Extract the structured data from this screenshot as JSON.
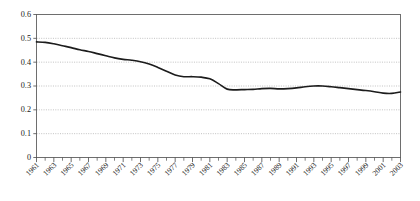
{
  "chart_data": {
    "type": "line",
    "title": "",
    "subtitle": "",
    "xlabel": "",
    "ylabel": "",
    "ylim": [
      0,
      0.6
    ],
    "xlim": [
      1961,
      2003
    ],
    "grid": true,
    "grid_orientation": "horizontal",
    "legend": false,
    "legend_position": "none",
    "yticks": [
      "0",
      "0.1",
      "0.2",
      "0.3",
      "0.4",
      "0.5",
      "0.6"
    ],
    "ytick_values": [
      0,
      0.1,
      0.2,
      0.3,
      0.4,
      0.5,
      0.6
    ],
    "xtick_labels": [
      "1961",
      "1963",
      "1965",
      "1967",
      "1969",
      "1971",
      "1973",
      "1975",
      "1977",
      "1979",
      "1981",
      "1983",
      "1985",
      "1987",
      "1989",
      "1991",
      "1993",
      "1995",
      "1997",
      "1999",
      "2001",
      "2003"
    ],
    "xtick_label_values": [
      1961,
      1963,
      1965,
      1967,
      1969,
      1971,
      1973,
      1975,
      1977,
      1979,
      1981,
      1983,
      1985,
      1987,
      1989,
      1991,
      1993,
      1995,
      1997,
      1999,
      2001,
      2003
    ],
    "xtick_label_rotation": -45,
    "series": [
      {
        "name": "series-1",
        "color": "#1c1c1c",
        "x": [
          1961,
          1962,
          1963,
          1964,
          1965,
          1966,
          1967,
          1968,
          1969,
          1970,
          1971,
          1972,
          1973,
          1974,
          1975,
          1976,
          1977,
          1978,
          1979,
          1980,
          1981,
          1982,
          1983,
          1984,
          1985,
          1986,
          1987,
          1988,
          1989,
          1990,
          1991,
          1992,
          1993,
          1994,
          1995,
          1996,
          1997,
          1998,
          1999,
          2000,
          2001,
          2002,
          2003
        ],
        "values": [
          0.485,
          0.483,
          0.477,
          0.469,
          0.461,
          0.452,
          0.445,
          0.436,
          0.427,
          0.418,
          0.412,
          0.408,
          0.402,
          0.392,
          0.378,
          0.362,
          0.346,
          0.339,
          0.339,
          0.337,
          0.33,
          0.31,
          0.287,
          0.284,
          0.285,
          0.286,
          0.289,
          0.29,
          0.288,
          0.289,
          0.292,
          0.297,
          0.3,
          0.3,
          0.297,
          0.293,
          0.289,
          0.285,
          0.281,
          0.276,
          0.27,
          0.269,
          0.275
        ]
      }
    ]
  }
}
